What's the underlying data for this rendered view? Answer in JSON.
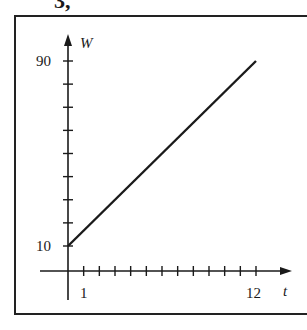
{
  "header_fragment": "3,",
  "chart_data": {
    "type": "line",
    "title": "",
    "xlabel": "t",
    "ylabel": "W",
    "x_ticks": [
      1,
      2,
      3,
      4,
      5,
      6,
      7,
      8,
      9,
      10,
      11,
      12
    ],
    "x_tick_labels": {
      "1": "1",
      "12": "12"
    },
    "y_ticks": [
      10,
      20,
      30,
      40,
      50,
      60,
      70,
      80,
      90
    ],
    "y_tick_labels": {
      "10": "10",
      "90": "90"
    },
    "xlim": [
      0,
      13
    ],
    "ylim": [
      0,
      95
    ],
    "grid": false,
    "legend": null,
    "series": [
      {
        "name": "W",
        "x": [
          0,
          12
        ],
        "y": [
          10,
          90
        ]
      }
    ]
  },
  "labels": {
    "y_axis_name": "W",
    "x_axis_name": "t",
    "y_top_label": "90",
    "y_bottom_label": "10",
    "x_first_label": "1",
    "x_last_label": "12"
  }
}
